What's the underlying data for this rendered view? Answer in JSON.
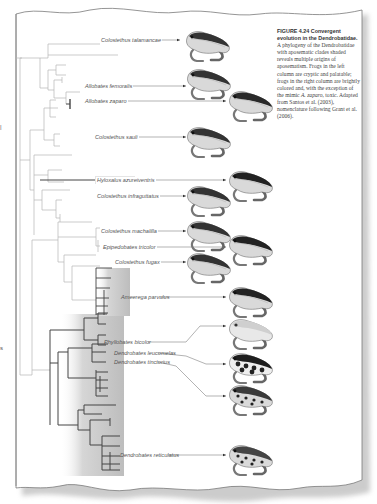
{
  "figure": {
    "number_label": "FIGURE 4.24",
    "title": "Convergent evolution in the Dendrobatidae.",
    "caption_parts": [
      {
        "text": "A phylogeny of the Dendrobatidae with aposematic clades shaded reveals multiple origins of aposematism. Frogs in the left column are cryptic and palatable; frogs in the right column are brightly colored and, with the exception of the mimic ",
        "italic": false
      },
      {
        "text": "A. zaparo",
        "italic": true
      },
      {
        "text": ", toxic. Adapted from Santos et al. (2003), nomenclature following Grant et al. (2006).",
        "italic": false
      }
    ]
  },
  "side_marks": [
    "|",
    "s"
  ],
  "species": [
    {
      "name": "Colostethus talamancae",
      "column": "left",
      "pattern": "cryptic",
      "aposematic": false
    },
    {
      "name": "Allobates femoralis",
      "column": "left",
      "pattern": "cryptic",
      "aposematic": false
    },
    {
      "name": "Allobates zaparo",
      "column": "right",
      "pattern": "mimic",
      "aposematic": false
    },
    {
      "name": "Colostethus sauli",
      "column": "left",
      "pattern": "cryptic",
      "aposematic": false
    },
    {
      "name": "Hyloxalus azureiventris",
      "column": "right",
      "pattern": "bright-striped",
      "aposematic": true
    },
    {
      "name": "Colostethus infraguttatus",
      "column": "left",
      "pattern": "cryptic",
      "aposematic": false
    },
    {
      "name": "Colostethus machalilla",
      "column": "left",
      "pattern": "cryptic",
      "aposematic": false
    },
    {
      "name": "Epipedobates tricolor",
      "column": "right",
      "pattern": "bright-striped",
      "aposematic": true
    },
    {
      "name": "Colostethus fugax",
      "column": "left",
      "pattern": "cryptic",
      "aposematic": false
    },
    {
      "name": "Ameerega parvulus",
      "column": "right",
      "pattern": "bright-striped",
      "aposematic": true
    },
    {
      "name": "Phyllobates bicolor",
      "column": "right",
      "pattern": "pale-uniform",
      "aposematic": true
    },
    {
      "name": "Dendrobates leucomelas",
      "column": "right",
      "pattern": "banded",
      "aposematic": true
    },
    {
      "name": "Dendrobates tinctorius",
      "column": "right",
      "pattern": "spotted",
      "aposematic": true
    },
    {
      "name": "Dendrobates reticulatus",
      "column": "right",
      "pattern": "reticulated",
      "aposematic": true
    }
  ],
  "colors": {
    "tree_gray": "#b5b5b5",
    "tree_dark": "#444444",
    "shade": "#c8c8c8",
    "paper_edge": "#777777",
    "text": "#555555"
  }
}
